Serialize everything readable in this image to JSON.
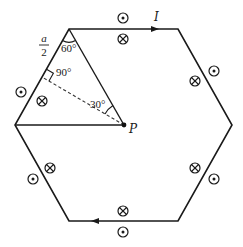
{
  "diagram": {
    "colors": {
      "stroke": "#1a1a1a",
      "background": "#ffffff"
    },
    "hexagon": {
      "vertices": [
        {
          "name": "top-left",
          "x": 69,
          "y": 29
        },
        {
          "name": "top-right",
          "x": 178,
          "y": 29
        },
        {
          "name": "right",
          "x": 232,
          "y": 125
        },
        {
          "name": "bottom-right",
          "x": 178,
          "y": 221
        },
        {
          "name": "bottom-left",
          "x": 69,
          "y": 221
        },
        {
          "name": "left",
          "x": 15,
          "y": 125
        }
      ]
    },
    "current": {
      "label": "I",
      "label_pos": {
        "x": 154,
        "y": 21
      },
      "arrows": [
        {
          "name": "top-edge-arrow",
          "x": 155,
          "y": 29,
          "direction": "right"
        },
        {
          "name": "bottom-edge-arrow",
          "x": 95,
          "y": 221,
          "direction": "left"
        }
      ]
    },
    "point_p": {
      "label": "P",
      "x": 124,
      "y": 125,
      "label_pos": {
        "x": 129,
        "y": 132
      }
    },
    "construction_lines": {
      "solid": [
        {
          "name": "line-p-to-top-left",
          "x1": 124,
          "y1": 125,
          "x2": 69,
          "y2": 29
        },
        {
          "name": "line-p-to-left",
          "x1": 124,
          "y1": 125,
          "x2": 15,
          "y2": 125
        }
      ],
      "dashed": [
        {
          "name": "perpendicular-p-to-left-upper-edge",
          "x1": 124,
          "y1": 125,
          "x2": 42,
          "y2": 77
        }
      ]
    },
    "labels": {
      "half_side": {
        "numerator": "a",
        "denominator": "2",
        "x": 44,
        "y": 42
      },
      "angle_60": {
        "text": "60°",
        "x": 64,
        "y": 51
      },
      "angle_90": {
        "text": "90°",
        "x": 54,
        "y": 75
      },
      "angle_30": {
        "text": "30°",
        "x": 91,
        "y": 108
      }
    },
    "field_symbols": [
      {
        "name": "top-outside-dot",
        "type": "out",
        "x": 123,
        "y": 18
      },
      {
        "name": "top-inside-cross",
        "type": "in",
        "x": 123,
        "y": 39
      },
      {
        "name": "upper-right-outside-dot",
        "type": "out",
        "x": 214,
        "y": 71
      },
      {
        "name": "upper-right-inside-cross",
        "type": "in",
        "x": 195,
        "y": 81
      },
      {
        "name": "lower-right-inside-cross",
        "type": "in",
        "x": 195,
        "y": 168
      },
      {
        "name": "lower-right-outside-dot",
        "type": "out",
        "x": 214,
        "y": 179
      },
      {
        "name": "bottom-inside-cross",
        "type": "in",
        "x": 123,
        "y": 211
      },
      {
        "name": "bottom-outside-dot",
        "type": "out",
        "x": 123,
        "y": 232
      },
      {
        "name": "lower-left-inside-cross",
        "type": "in",
        "x": 50,
        "y": 168
      },
      {
        "name": "lower-left-outside-dot",
        "type": "out",
        "x": 33,
        "y": 179
      },
      {
        "name": "upper-left-inside-cross",
        "type": "in",
        "x": 42,
        "y": 101
      },
      {
        "name": "upper-left-outside-dot",
        "type": "out",
        "x": 21,
        "y": 92
      }
    ]
  }
}
